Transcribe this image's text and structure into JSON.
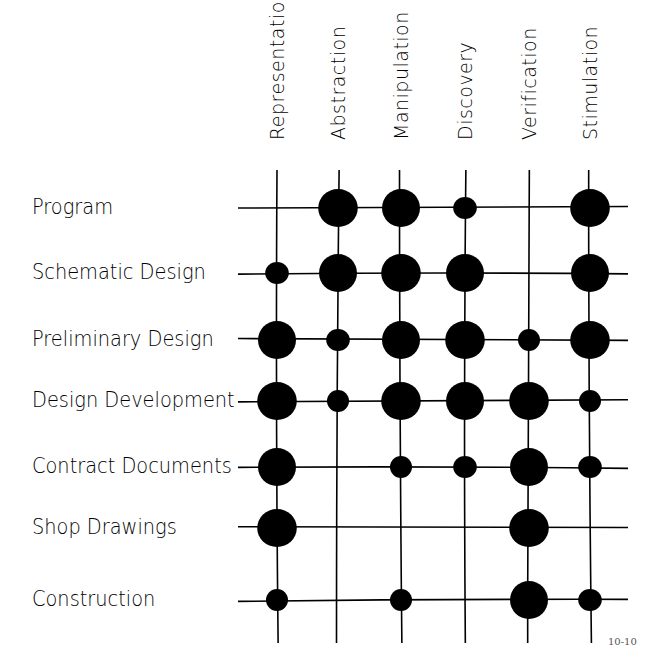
{
  "figure": {
    "columns": [
      "Representation",
      "Abstraction",
      "Manipulation",
      "Discovery",
      "Verification",
      "Stimulation"
    ],
    "rows": [
      "Program",
      "Schematic Design",
      "Preliminary Design",
      "Design Development",
      "Contract Documents",
      "Shop Drawings",
      "Construction"
    ],
    "page_number": "10-10",
    "legend_note": "dot size: 0 = none, 1 = small, 2 = large"
  },
  "chart_data": {
    "type": "table",
    "title": "",
    "columns": [
      "Representation",
      "Abstraction",
      "Manipulation",
      "Discovery",
      "Verification",
      "Stimulation"
    ],
    "rows": [
      "Program",
      "Schematic Design",
      "Preliminary Design",
      "Design Development",
      "Contract Documents",
      "Shop Drawings",
      "Construction"
    ],
    "values": [
      [
        0,
        2,
        2,
        1,
        0,
        2
      ],
      [
        1,
        2,
        2,
        2,
        0,
        2
      ],
      [
        2,
        1,
        2,
        2,
        1,
        2
      ],
      [
        2,
        1,
        2,
        2,
        2,
        1
      ],
      [
        2,
        0,
        1,
        1,
        2,
        1
      ],
      [
        2,
        0,
        0,
        0,
        2,
        0
      ],
      [
        1,
        0,
        1,
        0,
        2,
        1
      ]
    ],
    "scale": {
      "0": "none",
      "1": "small dot",
      "2": "large dot"
    },
    "layout": {
      "col_x": [
        277,
        338,
        401,
        465,
        529,
        590
      ],
      "row_y": [
        208,
        273,
        340,
        401,
        467,
        528,
        600
      ],
      "grid_x_range": [
        238,
        628
      ],
      "grid_y_range": [
        170,
        643
      ],
      "radius": {
        "1": 11,
        "2": 19
      },
      "ink_color": "#000000"
    }
  }
}
